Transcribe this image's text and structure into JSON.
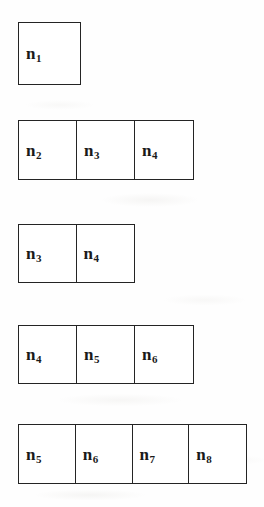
{
  "figure": {
    "type": "sliding-window-sequence-diagram",
    "background_color": "#fefefe",
    "border_color": "#242424",
    "text_color": "#1a1a1a",
    "rows": [
      {
        "id": "row-1",
        "cells": [
          {
            "base": "n",
            "sub": "1",
            "text": "n1"
          }
        ]
      },
      {
        "id": "row-2",
        "cells": [
          {
            "base": "n",
            "sub": "2",
            "text": "n2"
          },
          {
            "base": "n",
            "sub": "3",
            "text": "n3"
          },
          {
            "base": "n",
            "sub": "4",
            "text": "n4"
          }
        ]
      },
      {
        "id": "row-3",
        "cells": [
          {
            "base": "n",
            "sub": "3",
            "text": "n3"
          },
          {
            "base": "n",
            "sub": "4",
            "text": "n4"
          }
        ]
      },
      {
        "id": "row-4",
        "cells": [
          {
            "base": "n",
            "sub": "4",
            "text": "n4"
          },
          {
            "base": "n",
            "sub": "5",
            "text": "n5"
          },
          {
            "base": "n",
            "sub": "6",
            "text": "n6"
          }
        ]
      },
      {
        "id": "row-5",
        "cells": [
          {
            "base": "n",
            "sub": "5",
            "text": "n5"
          },
          {
            "base": "n",
            "sub": "6",
            "text": "n6"
          },
          {
            "base": "n",
            "sub": "7",
            "text": "n7"
          },
          {
            "base": "n",
            "sub": "8",
            "text": "n8"
          }
        ]
      }
    ]
  }
}
